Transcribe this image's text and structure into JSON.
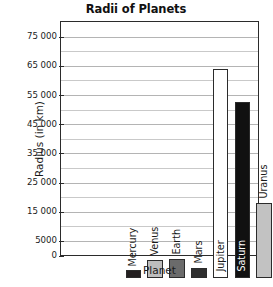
{
  "chart_data": {
    "type": "bar",
    "title": "Radii of Planets",
    "xlabel": "Planet",
    "ylabel": "Radius (in km)",
    "categories": [
      "Mercury",
      "Venus",
      "Earth",
      "Mars",
      "Jupiter",
      "Saturn",
      "Uranus",
      "Neptune",
      "Pluto"
    ],
    "values": [
      2440,
      6050,
      6370,
      3390,
      71500,
      60300,
      25600,
      24800,
      1200
    ],
    "ylim": [
      0,
      80000
    ],
    "ytick_labels": [
      "0",
      "5000",
      "15 000",
      "25 000",
      "35 000",
      "45 000",
      "55 000",
      "65 000",
      "75 000"
    ],
    "ytick_values": [
      0,
      5000,
      15000,
      25000,
      35000,
      45000,
      55000,
      65000,
      75000
    ],
    "minor_gridline_values": [
      10000,
      20000,
      30000,
      40000,
      50000,
      60000,
      70000
    ],
    "grid": true,
    "legend": "none",
    "bar_colors": [
      "#231f20",
      "#bdbdbd",
      "#6b6b6b",
      "#2e2e2e",
      "#ffffff",
      "#111111",
      "#c2c2c2",
      "#757575",
      "#141414"
    ],
    "bar_label_colors": [
      "#1a1a1a",
      "#1a1a1a",
      "#1a1a1a",
      "#1a1a1a",
      "#1a1a1a",
      "#ffffff",
      "#1a1a1a",
      "#1a1a1a",
      "#1a1a1a"
    ]
  }
}
